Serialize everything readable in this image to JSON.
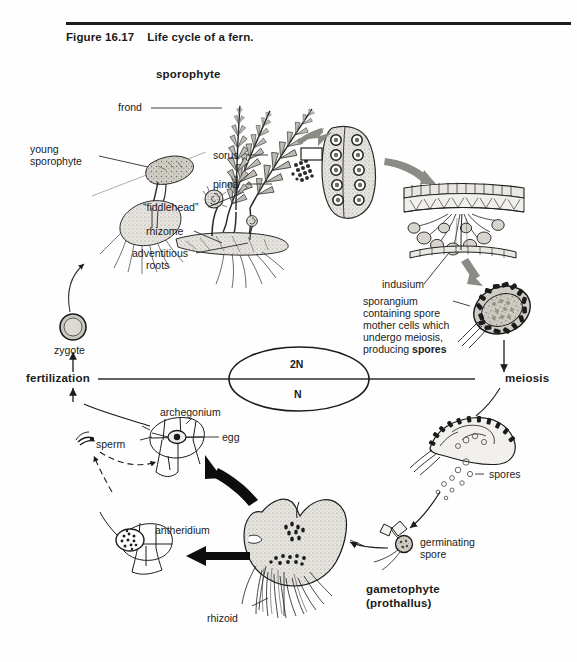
{
  "figure": {
    "number": "Figure 16.17",
    "title": "Life cycle of a fern."
  },
  "diagram_type": "biological-life-cycle",
  "ploidy_key": {
    "diploid": "2N",
    "haploid": "N"
  },
  "stages": {
    "sporophyte": "sporophyte",
    "young_sporophyte": "young\nsporophyte",
    "young_sporophyte_line1": "young",
    "young_sporophyte_line2": "sporophyte",
    "frond": "frond",
    "fiddlehead": "“fiddlehead”",
    "rhizome": "rhizome",
    "adventitious_roots_line1": "adventitious",
    "adventitious_roots_line2": "roots",
    "sorus": "sorus",
    "pinna": "pinna",
    "indusium": "indusium",
    "sporangium_line1": "sporangium",
    "sporangium_line2": "containing spore",
    "sporangium_line3": "mother cells which",
    "sporangium_line4": "undergo meiosis,",
    "sporangium_line5_a": "producing ",
    "sporangium_line5_b": "spores",
    "meiosis": "meiosis",
    "spores": "spores",
    "germinating_spore_line1": "germinating",
    "germinating_spore_line2": "spore",
    "gametophyte_line1": "gametophyte",
    "gametophyte_line2": "(prothallus)",
    "rhizoid": "rhizoid",
    "antheridium": "antheridium",
    "archegonium": "archegonium",
    "sperm": "sperm",
    "egg": "egg",
    "fertilization": "fertilization",
    "zygote": "zygote"
  },
  "colors": {
    "ink": "#1b1b1b",
    "leader": "#2b2b2b",
    "fill_light": "#d8d6d0",
    "fill_mid": "#b9b6ae",
    "paper": "#fefefe"
  }
}
